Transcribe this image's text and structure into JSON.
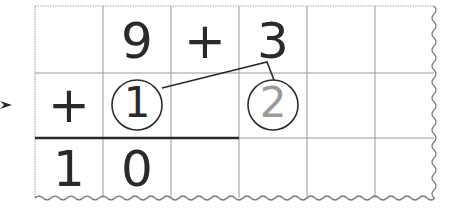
{
  "problem": {
    "expression": "9 + 3",
    "row1": [
      "",
      "9",
      "+",
      "3",
      "",
      ""
    ],
    "row2": [
      "+",
      "1",
      "",
      "2",
      "",
      ""
    ],
    "row3": [
      "1",
      "0",
      "",
      "",
      "",
      ""
    ]
  },
  "carry": {
    "circled_one": "1",
    "circled_two": "2"
  },
  "colors": {
    "ink": "#2a2a2a",
    "grid": "#9a9a9a",
    "faded_digit": "#9a9a9a"
  }
}
